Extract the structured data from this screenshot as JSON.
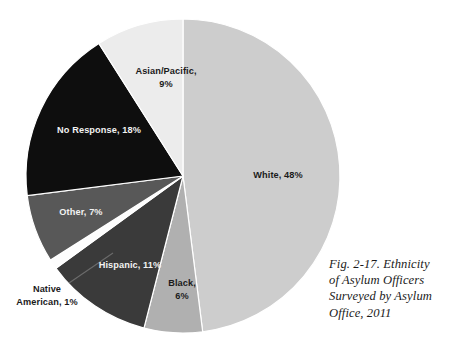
{
  "figure": {
    "caption": "Fig. 2-17. Ethnicity of Asylum Officers Surveyed by Asylum Office, 2011",
    "caption_lines": [
      "Fig. 2-17. Ethnicity",
      "of Asylum Officers",
      "Surveyed by Asylum",
      "Office, 2011"
    ]
  },
  "chart_data": {
    "type": "pie",
    "xlabel": "",
    "ylabel": "",
    "units": "percent",
    "total": 100,
    "start_angle_deg": 0,
    "direction": "clockwise",
    "grid": false,
    "legend": "none (labels drawn on slices)",
    "categories": [
      "White",
      "Black",
      "Hispanic",
      "Native American",
      "Other",
      "No Response",
      "Asian/Pacific"
    ],
    "values": [
      48,
      6,
      11,
      1,
      7,
      18,
      9
    ],
    "colors": [
      "#cdcdcd",
      "#b0b0b0",
      "#3a3a3a",
      "#fdfdfd",
      "#585858",
      "#0e0e0e",
      "#ececec"
    ],
    "slices": [
      {
        "name": "White",
        "value": 48,
        "label": "White, 48%",
        "label_lines": [
          "White, 48%"
        ],
        "color": "#cdcdcd",
        "label_color": "dark",
        "label_position": "inside",
        "label_x": 278,
        "label_y": 178
      },
      {
        "name": "Black",
        "value": 6,
        "label": "Black, 6%",
        "label_lines": [
          "Black,",
          "6%"
        ],
        "color": "#b0b0b0",
        "label_color": "dark",
        "label_position": "inside",
        "label_x": 182,
        "label_y": 286
      },
      {
        "name": "Hispanic",
        "value": 11,
        "label": "Hispanic, 11%",
        "label_lines": [
          "Hispanic, 11%"
        ],
        "color": "#3a3a3a",
        "label_color": "light",
        "label_position": "inside",
        "label_x": 130,
        "label_y": 268
      },
      {
        "name": "Native American",
        "value": 1,
        "label": "Native American, 1%",
        "label_lines": [
          "Native",
          "American, 1%"
        ],
        "color": "#fdfdfd",
        "label_color": "dark",
        "label_position": "outside",
        "label_x": 47,
        "label_y": 292
      },
      {
        "name": "Other",
        "value": 7,
        "label": "Other, 7%",
        "label_lines": [
          "Other, 7%"
        ],
        "color": "#585858",
        "label_color": "light",
        "label_position": "inside",
        "label_x": 81,
        "label_y": 215
      },
      {
        "name": "No Response",
        "value": 18,
        "label": "No Response, 18%",
        "label_lines": [
          "No Response, 18%"
        ],
        "color": "#0e0e0e",
        "label_color": "light",
        "label_position": "inside",
        "label_x": 99,
        "label_y": 133
      },
      {
        "name": "Asian/Pacific",
        "value": 9,
        "label": "Asian/Pacific, 9%",
        "label_lines": [
          "Asian/Pacific,",
          "9%"
        ],
        "color": "#ececec",
        "label_color": "dark",
        "label_position": "inside",
        "label_x": 166,
        "label_y": 74
      }
    ]
  }
}
